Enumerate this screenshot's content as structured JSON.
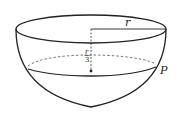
{
  "diagram": {
    "labels": {
      "radius": "r",
      "depth_num": "r",
      "depth_den": "3",
      "point": "P"
    },
    "colors": {
      "stroke": "#222222",
      "background": "#ffffff"
    }
  }
}
